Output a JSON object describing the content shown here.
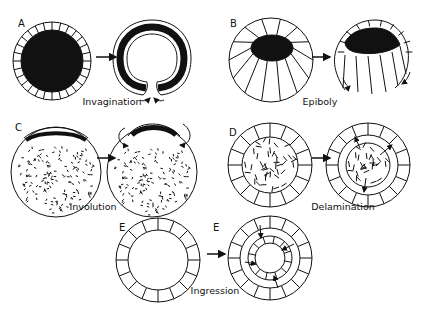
{
  "figure": {
    "panels": [
      {
        "letter": "A",
        "caption": "Invagination"
      },
      {
        "letter": "B",
        "caption": "Epiboly"
      },
      {
        "letter": "C",
        "caption": "Involution"
      },
      {
        "letter": "D",
        "caption": "Delamination"
      },
      {
        "letter": "E",
        "letter_after": "E",
        "caption": "Ingression"
      }
    ],
    "colors": {
      "ink": "#111111",
      "background": "#ffffff"
    }
  }
}
